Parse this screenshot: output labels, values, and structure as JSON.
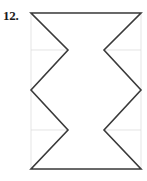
{
  "problem": {
    "label": "12."
  },
  "figure": {
    "name": "six-pointed-star-polygon-net",
    "stroke_color": "#3a3a3a",
    "stroke_width": 1.6,
    "fill_color": "#ffffff",
    "grid_color": "#d9d9d9",
    "grid_stroke_width": 0.7,
    "bounds": {
      "x_min": 31,
      "x_max": 141,
      "y_min": 13,
      "y_max": 169
    },
    "grid_lines": {
      "vertical_x": [
        68,
        104
      ],
      "horizontal_y": [
        50,
        90,
        130
      ]
    },
    "outline_points": [
      [
        31,
        13
      ],
      [
        141,
        13
      ],
      [
        104,
        50
      ],
      [
        141,
        90
      ],
      [
        104,
        130
      ],
      [
        141,
        169
      ],
      [
        31,
        169
      ],
      [
        68,
        130
      ],
      [
        31,
        90
      ],
      [
        68,
        50
      ]
    ]
  }
}
